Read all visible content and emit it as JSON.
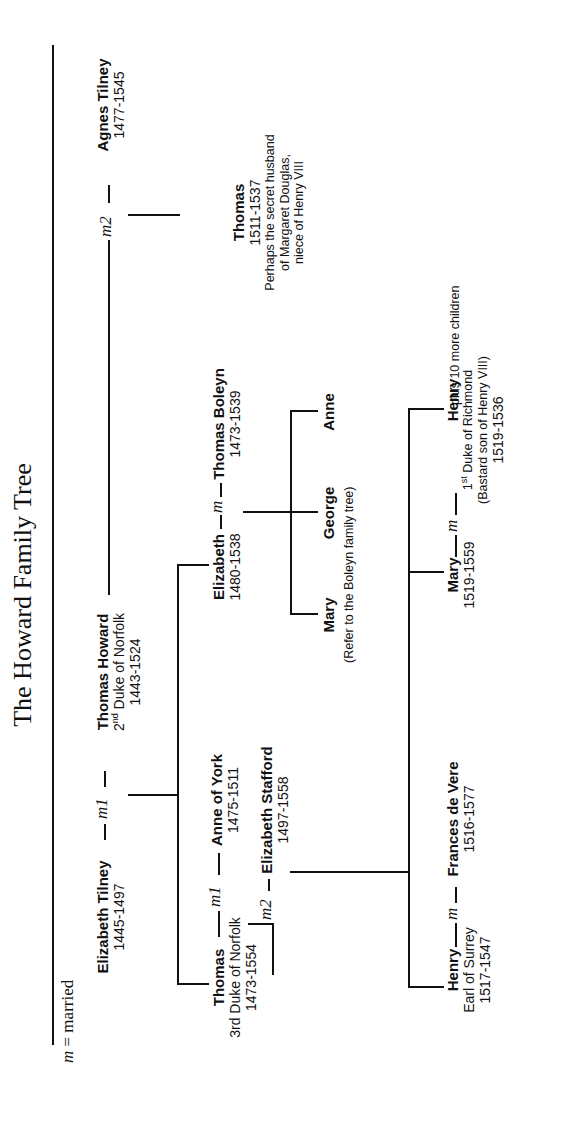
{
  "title": "The Howard Family Tree",
  "legend": {
    "symbol": "m",
    "text": " = married"
  },
  "generation1": {
    "elizabeth_tilney": {
      "name": "Elizabeth Tilney",
      "dates": "1445-1497"
    },
    "marriage1_label": "m1",
    "thomas_howard": {
      "name": "Thomas Howard",
      "title_ord": "2",
      "title_sup": "nd",
      "title_rest": " Duke of Norfolk",
      "dates": "1443-1524"
    },
    "marriage2_label": "m2",
    "agnes_tilney": {
      "name": "Agnes Tilney",
      "dates": "1477-1545"
    }
  },
  "generation2": {
    "thomas_3rd_duke": {
      "name": "Thomas",
      "title": "3rd Duke of Norfolk",
      "dates": "1473-1554"
    },
    "anne_marriage_label": "m1",
    "anne_of_york": {
      "name": "Anne of York",
      "dates": "1475-1511"
    },
    "stafford_marriage_label": "m2",
    "elizabeth_stafford": {
      "name": "Elizabeth Stafford",
      "dates": "1497-1558"
    },
    "elizabeth_howard": {
      "name": "Elizabeth",
      "dates": "1480-1538"
    },
    "boleyn_marriage_label": "m",
    "thomas_boleyn": {
      "name": "Thomas Boleyn",
      "dates": "1473-1539"
    },
    "thomas_son": {
      "name": "Thomas",
      "dates": "1511-1537",
      "note_lines": [
        "Perhaps the secret husband",
        "of Margaret Douglas,",
        "niece of Henry VIII"
      ]
    }
  },
  "boleyn_children": {
    "names": [
      "Mary",
      "George",
      "Anne"
    ],
    "note": "(Refer to the Boleyn family tree)"
  },
  "generation3": {
    "henry_surrey": {
      "name": "Henry",
      "title": "Earl of Surrey",
      "dates": "1517-1547"
    },
    "surrey_marriage_label": "m",
    "frances_de_vere": {
      "name": "Frances de Vere",
      "dates": "1516-1577"
    },
    "mary_howard": {
      "name": "Mary",
      "dates": "1519-1559"
    },
    "richmond_marriage_label": "m",
    "henry_richmond": {
      "name": "Henry",
      "title_ord": "1",
      "title_sup": "st",
      "title_rest": " Duke of Richmond",
      "note": "(Bastard son of Henry VIII)",
      "dates": "1519-1536"
    },
    "more_children": "plus 10 more children"
  }
}
